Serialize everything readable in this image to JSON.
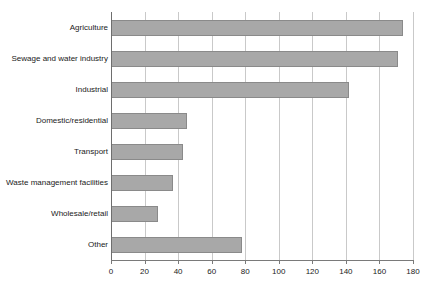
{
  "chart_data": {
    "type": "bar",
    "orientation": "horizontal",
    "title": "",
    "subtitle": "",
    "xlabel": "",
    "ylabel": "",
    "xlim": [
      0,
      180
    ],
    "xticks": [
      0,
      20,
      40,
      60,
      80,
      100,
      120,
      140,
      160,
      180
    ],
    "xtick_labels": [
      "0",
      "20",
      "40",
      "60",
      "80",
      "100",
      "120",
      "140",
      "160",
      "180"
    ],
    "grid": "vertical",
    "legend": "none",
    "categories": [
      "Agriculture",
      "Sewage and water industry",
      "Industrial",
      "Domestic/residential",
      "Transport",
      "Waste management facilities",
      "Wholesale/retail",
      "Other"
    ],
    "values": [
      174,
      171,
      142,
      45,
      43,
      37,
      28,
      78
    ],
    "bars": [
      {
        "label": "Agriculture",
        "value": 174
      },
      {
        "label": "Sewage and water industry",
        "value": 171
      },
      {
        "label": "Industrial",
        "value": 142
      },
      {
        "label": "Domestic/residential",
        "value": 45
      },
      {
        "label": "Transport",
        "value": 43
      },
      {
        "label": "Waste management facilities",
        "value": 37
      },
      {
        "label": "Wholesale/retail",
        "value": 28
      },
      {
        "label": "Other",
        "value": 78
      }
    ],
    "colors": {
      "bar_fill": "#a8a8a8",
      "bar_stroke": "#8a8a8a",
      "gridline": "#c9c9c9",
      "axis": "#6e6e6e",
      "text": "#1a1a1a",
      "background": "#ffffff"
    }
  }
}
